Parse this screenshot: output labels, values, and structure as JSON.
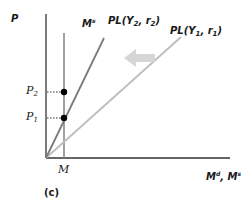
{
  "figure": {
    "panel_label": "(c)",
    "y_axis_label": "P",
    "x_axis_label": {
      "main": "M",
      "sup1": "d",
      "sep": ", ",
      "main2": "M",
      "sup2": "s"
    },
    "money_supply_label": {
      "main": "M",
      "sup": "s"
    },
    "x_tick_label": "M",
    "y_tick_labels": [
      {
        "main": "P",
        "sub": "2"
      },
      {
        "main": "P",
        "sub": "1"
      }
    ],
    "curves": [
      {
        "name": "PL(Y2, r2)",
        "prefix": "PL(Y",
        "sub1": "2",
        "mid": ", r",
        "sub2": "2",
        "suffix": ")",
        "color": "#7a7a7a"
      },
      {
        "name": "PL(Y1, r1)",
        "prefix": "PL(Y",
        "sub1": "1",
        "mid": ", r",
        "sub2": "1",
        "suffix": ")",
        "color": "#bdbdbd"
      }
    ],
    "shift_arrow": {
      "direction": "left",
      "color": "#d0d0d0"
    },
    "colors": {
      "axis": "#333333",
      "money_supply": "#8a8a8a",
      "dots": "#000000",
      "guides": "#333333"
    }
  }
}
